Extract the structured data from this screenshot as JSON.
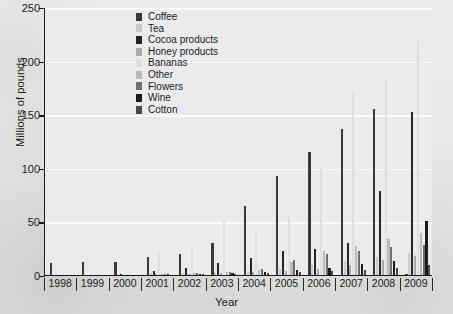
{
  "chart_data": {
    "type": "bar",
    "title": "",
    "xlabel": "Year",
    "ylabel": "Millions of pounds",
    "categories": [
      "1998",
      "1999",
      "2000",
      "2001",
      "2002",
      "2003",
      "2004",
      "2005",
      "2006",
      "2007",
      "2008",
      "2009"
    ],
    "ylim": [
      0,
      250
    ],
    "yticks": [
      0,
      50,
      100,
      150,
      200,
      250
    ],
    "grid": true,
    "legend_position": "top-center",
    "series": [
      {
        "name": "Coffee",
        "color": "#3a3a3a",
        "values": [
          11,
          12,
          12,
          17,
          20,
          30,
          64,
          92,
          115,
          136,
          155,
          1
        ]
      },
      {
        "name": "Tea",
        "color": "#c9c9c9",
        "values": [
          0,
          0,
          1,
          2,
          2,
          3,
          4,
          6,
          9,
          13,
          17,
          21
        ]
      },
      {
        "name": "Cocoa products",
        "color": "#262626",
        "values": [
          0,
          0,
          1,
          4,
          7,
          11,
          16,
          22,
          24,
          30,
          78,
          152
        ]
      },
      {
        "name": "Honey products",
        "color": "#a8a8a8",
        "values": [
          0,
          0,
          0,
          1,
          1,
          2,
          3,
          4,
          6,
          9,
          14,
          18
        ]
      },
      {
        "name": "Bananas",
        "color": "#e0e0e0",
        "values": [
          0,
          0,
          1,
          21,
          27,
          50,
          40,
          55,
          99,
          172,
          183,
          218
        ]
      },
      {
        "name": "Other",
        "color": "#b9b9b9",
        "values": [
          0,
          0,
          0,
          1,
          2,
          3,
          5,
          12,
          22,
          27,
          34,
          39
        ]
      },
      {
        "name": "Flowers",
        "color": "#6e6e6e",
        "values": [
          0,
          0,
          0,
          1,
          2,
          3,
          6,
          14,
          20,
          22,
          26,
          28
        ]
      },
      {
        "name": "Wine",
        "color": "#1a1a1a",
        "values": [
          0,
          0,
          0,
          1,
          1,
          2,
          3,
          5,
          7,
          10,
          13,
          50
        ]
      },
      {
        "name": "Cotton",
        "color": "#4a4a4a",
        "values": [
          0,
          0,
          0,
          0,
          1,
          1,
          2,
          3,
          4,
          5,
          7,
          9
        ]
      }
    ]
  },
  "axes": {
    "y_title": "Millions of pounds",
    "x_title": "Year",
    "y_tick_labels": [
      "0",
      "50",
      "100",
      "150",
      "200",
      "250"
    ],
    "x_tick_labels": [
      "1998",
      "1999",
      "2000",
      "2001",
      "2002",
      "2003",
      "2004",
      "2005",
      "2006",
      "2007",
      "2008",
      "2009"
    ]
  },
  "legend": {
    "items": [
      {
        "label": "Coffee",
        "color": "#3a3a3a"
      },
      {
        "label": "Tea",
        "color": "#c9c9c9"
      },
      {
        "label": "Cocoa products",
        "color": "#262626"
      },
      {
        "label": "Honey products",
        "color": "#a8a8a8"
      },
      {
        "label": "Bananas",
        "color": "#e0e0e0"
      },
      {
        "label": "Other",
        "color": "#b9b9b9"
      },
      {
        "label": "Flowers",
        "color": "#6e6e6e"
      },
      {
        "label": "Wine",
        "color": "#1a1a1a"
      },
      {
        "label": "Cotton",
        "color": "#4a4a4a"
      }
    ]
  },
  "style": {
    "plot_background": "#ebebeb",
    "gridline_color": "#fbfbfb",
    "axis_color": "#1a1a1a",
    "text_color": "#1b1b1b",
    "page_background": "#e8e8e6"
  }
}
